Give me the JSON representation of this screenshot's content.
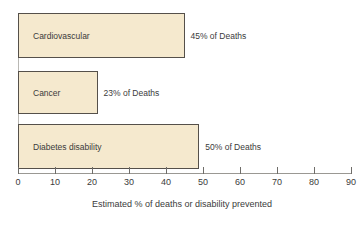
{
  "chart_data": {
    "type": "bar",
    "orientation": "horizontal",
    "title": "",
    "xlabel": "Estimated % of deaths or disability prevented",
    "ylabel": "",
    "xlim": [
      0,
      90
    ],
    "grid": false,
    "legend": null,
    "categories": [
      "Cardiovascular",
      "Cancer",
      "Diabetes disability"
    ],
    "values": [
      45,
      21.5,
      49
    ],
    "tick_labels": [
      "0",
      "10",
      "20",
      "30",
      "40",
      "50",
      "60",
      "70",
      "80",
      "90"
    ],
    "tick_values": [
      0,
      10,
      20,
      30,
      40,
      50,
      60,
      70,
      80,
      90
    ],
    "annotations": [
      "45% of Deaths",
      "23% of Deaths",
      "50% of Deaths"
    ],
    "bars": [
      {
        "label": "Cardiovascular",
        "value": 45,
        "annotation": "45% of Deaths",
        "top": 13,
        "height": 45
      },
      {
        "label": "Cancer",
        "value": 21.5,
        "annotation": "23% of Deaths",
        "top": 71,
        "height": 43
      },
      {
        "label": "Diabetes disability",
        "value": 49,
        "annotation": "50% of Deaths",
        "top": 124,
        "height": 45
      }
    ],
    "colors": {
      "bar_fill": "#F5E9CE",
      "bar_border": "#55504A",
      "axis": "#9A9893",
      "text": "#3B3B3B",
      "background": "#FFFFFF"
    }
  }
}
